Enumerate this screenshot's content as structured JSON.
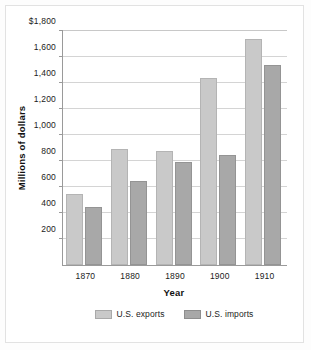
{
  "chart_data": {
    "type": "bar",
    "title": "",
    "xlabel": "Year",
    "ylabel": "Millions of dollars",
    "categories": [
      "1870",
      "1880",
      "1890",
      "1900",
      "1910"
    ],
    "series": [
      {
        "name": "U.S. exports",
        "color": "#c9c9c9",
        "values": [
          545,
          890,
          875,
          1440,
          1740
        ]
      },
      {
        "name": "U.S. imports",
        "color": "#a8a8a8",
        "values": [
          445,
          645,
          795,
          845,
          1540
        ]
      }
    ],
    "ylim": [
      0,
      1800
    ],
    "ytick_values": [
      1800,
      1600,
      1400,
      1200,
      1000,
      800,
      600,
      400,
      200
    ],
    "ytick_labels": [
      "$1,800",
      "1,600",
      "1,400",
      "1,200",
      "1,000",
      "800",
      "600",
      "400",
      "200"
    ],
    "grid": true,
    "legend_position": "bottom"
  },
  "axes": {
    "y": {
      "title": "Millions of dollars",
      "ticks": [
        {
          "label": "$1,800",
          "value": 1800
        },
        {
          "label": "1,600",
          "value": 1600
        },
        {
          "label": "1,400",
          "value": 1400
        },
        {
          "label": "1,200",
          "value": 1200
        },
        {
          "label": "1,000",
          "value": 1000
        },
        {
          "label": "800",
          "value": 800
        },
        {
          "label": "600",
          "value": 600
        },
        {
          "label": "400",
          "value": 400
        },
        {
          "label": "200",
          "value": 200
        }
      ]
    },
    "x": {
      "title": "Year",
      "ticks": [
        "1870",
        "1880",
        "1890",
        "1900",
        "1910"
      ]
    }
  },
  "legend": {
    "items": [
      {
        "label": "U.S. exports",
        "swatch": "exports-swatch"
      },
      {
        "label": "U.S. imports",
        "swatch": "imports-swatch"
      }
    ]
  }
}
